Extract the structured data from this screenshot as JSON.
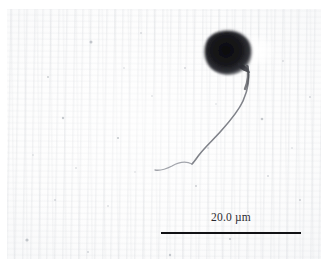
{
  "figure": {
    "kind": "light-micrograph",
    "width_px": 326,
    "height_px": 259,
    "background_color": "#fdfdfd"
  },
  "specimen": {
    "cell_body": {
      "label": "cell-body",
      "color": "#1a1a1e",
      "center_x_px": 228,
      "center_y_px": 52,
      "width_px": 44,
      "height_px": 40,
      "shape": "ovoid"
    },
    "flagellum": {
      "label": "flagellum",
      "color": "#7b7d85",
      "origin_x_px": 248,
      "origin_y_px": 66,
      "tip_x_px": 155,
      "tip_y_px": 170
    },
    "halo": {
      "label": "light-halo",
      "color": "#ffffff"
    }
  },
  "scalebar": {
    "label": "20.0 µm",
    "value": 20.0,
    "unit": "µm",
    "bar_color": "#111114",
    "text_color": "#2b2b30",
    "bar_left_px": 161,
    "bar_right_px": 301,
    "bar_y_px": 232,
    "bar_length_px": 140
  }
}
